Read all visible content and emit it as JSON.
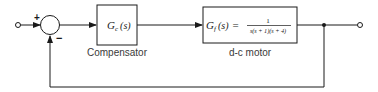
{
  "diagram": {
    "type": "block-diagram",
    "title": "",
    "summing_junction": {
      "plus_sign": "+",
      "minus_sign": "−"
    },
    "blocks": [
      {
        "id": "compensator",
        "symbol": "G",
        "subscript": "c",
        "argument": "(s)",
        "caption": "Compensator"
      },
      {
        "id": "motor",
        "symbol": "G",
        "subscript": "f",
        "argument": "(s)",
        "equals": "=",
        "numerator": "1",
        "denominator": "s(s + 1)(s + 4)",
        "caption": "d-c motor"
      }
    ],
    "feedback": "unity negative feedback",
    "colors": {
      "line": "#1a1a1a",
      "text": "#3a3a3a",
      "background": "#ffffff"
    }
  }
}
